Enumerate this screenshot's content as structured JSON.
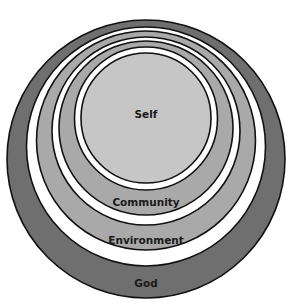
{
  "diagram": {
    "type": "nested-circles",
    "layers": [
      {
        "label": "God",
        "color": "#6f6f6f"
      },
      {
        "label": "Environment",
        "color": "#a9a9a9"
      },
      {
        "label": "Community",
        "color": "#a9a9a9"
      },
      {
        "label": "Self",
        "color": "#c6c6c6"
      }
    ],
    "labels": {
      "self": "Self",
      "community": "Community",
      "environment": "Environment",
      "god": "God"
    }
  }
}
